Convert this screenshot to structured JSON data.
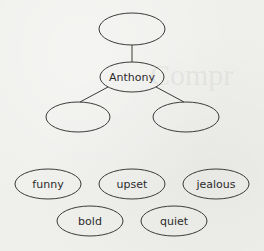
{
  "diagram": {
    "type": "character-trait-web",
    "center_name": "Anthony",
    "nodes": [
      {
        "id": "top",
        "label": "",
        "cx": 132,
        "cy": 29,
        "rx": 33,
        "ry": 16
      },
      {
        "id": "center",
        "label": "Anthony",
        "cx": 132,
        "cy": 77,
        "rx": 32,
        "ry": 15
      },
      {
        "id": "left",
        "label": "",
        "cx": 78,
        "cy": 117,
        "rx": 32,
        "ry": 15
      },
      {
        "id": "right",
        "label": "",
        "cx": 186,
        "cy": 117,
        "rx": 33,
        "ry": 15
      }
    ],
    "edges": [
      {
        "from": "top",
        "to": "center",
        "x1": 132,
        "y1": 45,
        "x2": 132,
        "y2": 62
      },
      {
        "from": "center",
        "to": "left",
        "x1": 108,
        "y1": 87,
        "x2": 80,
        "y2": 102
      },
      {
        "from": "center",
        "to": "right",
        "x1": 156,
        "y1": 87,
        "x2": 184,
        "y2": 102
      }
    ]
  },
  "word_bank": {
    "words": [
      {
        "label": "funny",
        "cx": 48,
        "cy": 184,
        "rx": 33,
        "ry": 15
      },
      {
        "label": "upset",
        "cx": 132,
        "cy": 184,
        "rx": 33,
        "ry": 15
      },
      {
        "label": "jealous",
        "cx": 216,
        "cy": 184,
        "rx": 33,
        "ry": 15
      },
      {
        "label": "bold",
        "cx": 90,
        "cy": 221,
        "rx": 33,
        "ry": 15
      },
      {
        "label": "quiet",
        "cx": 174,
        "cy": 221,
        "rx": 33,
        "ry": 15
      }
    ]
  },
  "style": {
    "stroke": "#3a3a3a",
    "text": "#2b2b2b",
    "background": "#efefec"
  }
}
